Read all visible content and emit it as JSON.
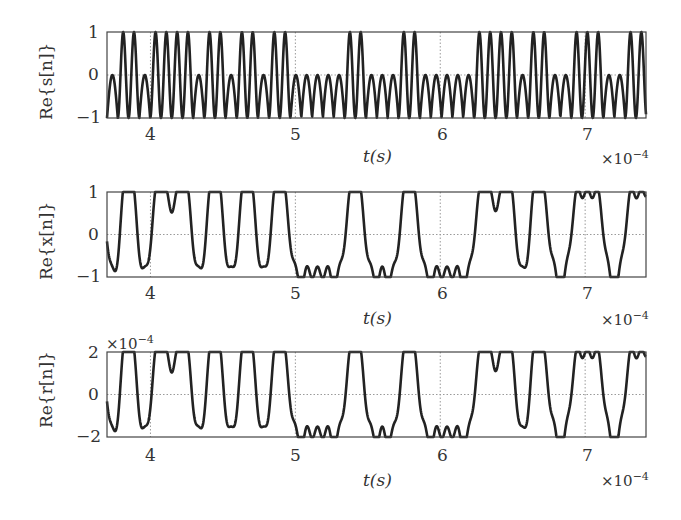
{
  "chart_data": [
    {
      "type": "line",
      "ylabel": "Re{s[n]}",
      "xlabel": "t(s)",
      "x_scale_label": "×10",
      "x_scale_exp": "−4",
      "y_scale_label": "",
      "y_scale_exp": "",
      "xlim": [
        3.7,
        7.42
      ],
      "ylim": [
        -1,
        1
      ],
      "xticks": [
        "4",
        "5",
        "6",
        "7"
      ],
      "xtick_values": [
        4,
        5,
        6,
        7
      ],
      "yticks": [
        "1",
        "0",
        "−1"
      ],
      "ytick_values": [
        1,
        0,
        -1
      ],
      "grid": "dotted",
      "style": "sharp"
    },
    {
      "type": "line",
      "ylabel": "Re{x[n]}",
      "xlabel": "t(s)",
      "x_scale_label": "×10",
      "x_scale_exp": "−4",
      "y_scale_label": "",
      "y_scale_exp": "",
      "xlim": [
        3.7,
        7.42
      ],
      "ylim": [
        -1,
        1
      ],
      "xticks": [
        "4",
        "5",
        "6",
        "7"
      ],
      "xtick_values": [
        4,
        5,
        6,
        7
      ],
      "yticks": [
        "1",
        "0",
        "−1"
      ],
      "ytick_values": [
        1,
        0,
        -1
      ],
      "grid": "dotted",
      "style": "smooth"
    },
    {
      "type": "line",
      "ylabel": "Re{r[n]}",
      "xlabel": "t(s)",
      "x_scale_label": "×10",
      "x_scale_exp": "−4",
      "y_scale_label": "×10",
      "y_scale_exp": "−4",
      "xlim": [
        3.7,
        7.42
      ],
      "ylim": [
        -2,
        2
      ],
      "xticks": [
        "4",
        "5",
        "6",
        "7"
      ],
      "xtick_values": [
        4,
        5,
        6,
        7
      ],
      "yticks": [
        "2",
        "0",
        "−2"
      ],
      "ytick_values": [
        2,
        0,
        -2
      ],
      "grid": "dotted",
      "style": "smooth"
    }
  ],
  "signal": {
    "chip_period": 0.0745,
    "t_start": 3.7,
    "chips": [
      0,
      1,
      1,
      0,
      1,
      1,
      1,
      1,
      0,
      1,
      1,
      0,
      1,
      1,
      0,
      1,
      1,
      0,
      0,
      0,
      0,
      0,
      1,
      1,
      0,
      0,
      0,
      1,
      1,
      0,
      0,
      0,
      0,
      0,
      1,
      1,
      1,
      1,
      0,
      1,
      1,
      0,
      0,
      1,
      1,
      1,
      0,
      0,
      1,
      1,
      1,
      0,
      0,
      0,
      1,
      1,
      0,
      1,
      1,
      0,
      0,
      0,
      1,
      1,
      0,
      0,
      1
    ]
  }
}
